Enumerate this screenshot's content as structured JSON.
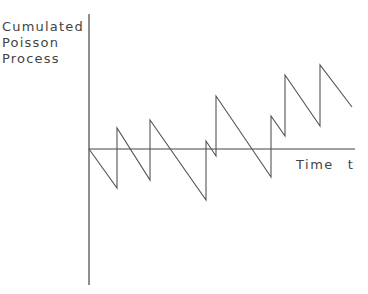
{
  "chart_data": {
    "type": "line",
    "title": "",
    "ylabel_lines": [
      "Cumulated",
      "Poisson",
      "Process"
    ],
    "xlabel": "Time",
    "xlabel_symbol": "t",
    "grid": false,
    "legend": null,
    "axes": {
      "origin_px": [
        89,
        149
      ],
      "y_axis_px": {
        "x": 89,
        "y_top": 14,
        "y_bottom": 285
      },
      "x_axis_px": {
        "y": 149,
        "x_left": 89,
        "x_right": 355
      }
    },
    "path_px": [
      [
        89,
        149
      ],
      [
        117,
        188
      ],
      [
        117,
        128
      ],
      [
        150,
        180
      ],
      [
        150,
        120
      ],
      [
        206,
        200
      ],
      [
        206,
        141
      ],
      [
        216,
        156
      ],
      [
        216,
        96
      ],
      [
        271,
        177
      ],
      [
        271,
        116
      ],
      [
        285,
        136
      ],
      [
        285,
        75
      ],
      [
        320,
        126
      ],
      [
        320,
        65
      ],
      [
        352,
        107
      ]
    ],
    "jump_times_px": [
      117,
      150,
      206,
      216,
      271,
      285,
      320
    ],
    "line_color": "#555555",
    "axis_color": "#444444"
  }
}
